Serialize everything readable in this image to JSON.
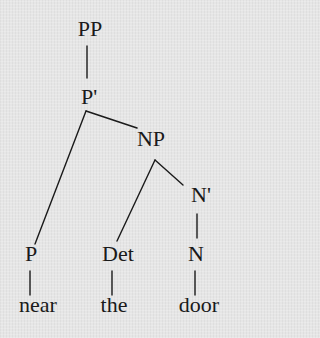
{
  "diagram": {
    "type": "syntax-tree",
    "colors": {
      "background": "#e6e6e6",
      "ink": "#1a1a1a"
    },
    "nodes": {
      "pp": {
        "label": "PP",
        "x": 90,
        "y": 20
      },
      "pbar": {
        "label": "P'",
        "x": 88,
        "y": 88
      },
      "np": {
        "label": "NP",
        "x": 151,
        "y": 130
      },
      "nbar": {
        "label": "N'",
        "x": 200,
        "y": 186
      },
      "p": {
        "label": "P",
        "x": 30,
        "y": 245
      },
      "det": {
        "label": "Det",
        "x": 118,
        "y": 245
      },
      "n": {
        "label": "N",
        "x": 196,
        "y": 245
      }
    },
    "words": {
      "near": {
        "label": "near",
        "x": 38,
        "y": 296
      },
      "the": {
        "label": "the",
        "x": 114,
        "y": 296
      },
      "door": {
        "label": "door",
        "x": 198,
        "y": 296
      }
    },
    "edges": [
      {
        "from": "PP",
        "to": "P'"
      },
      {
        "from": "P'",
        "to": "P"
      },
      {
        "from": "P'",
        "to": "NP"
      },
      {
        "from": "NP",
        "to": "Det"
      },
      {
        "from": "NP",
        "to": "N'"
      },
      {
        "from": "N'",
        "to": "N"
      },
      {
        "from": "P",
        "to": "near"
      },
      {
        "from": "Det",
        "to": "the"
      },
      {
        "from": "N",
        "to": "door"
      }
    ]
  }
}
